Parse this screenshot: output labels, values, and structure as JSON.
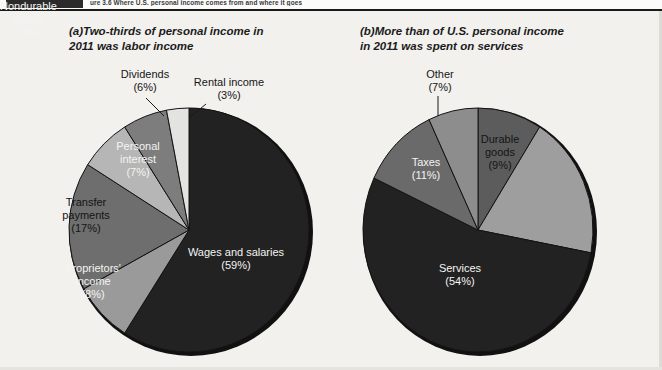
{
  "banner": {
    "caption": "ure 3.6  Where U.S. personal income comes from and where it goes",
    "tab_label": ""
  },
  "panels": [
    {
      "tag": "(a)",
      "title": "Two-thirds of personal income in\n2011 was labor income"
    },
    {
      "tag": "(b)",
      "title": "More than of U.S. personal income\nin 2011 was spent on services"
    }
  ],
  "labels": {
    "dividends": "Dividends\n(6%)",
    "rental": "Rental income\n(3%)",
    "personal_interest": "Personal\ninterest\n(7%)",
    "transfer_payments": "Transfer\npayments\n(17%)",
    "proprietors_income": "Proprietors'\nincome\n(8%)",
    "wages_salaries": "Wages and salaries\n(59%)",
    "other": "Other\n(7%)",
    "durable_goods": "Durable\ngoods\n(9%)",
    "nondurable_goods": "Nondurable\ngoods\n(19%)",
    "services": "Services\n(54%)",
    "taxes": "Taxes\n(11%)"
  },
  "chart_data": [
    {
      "type": "pie",
      "id": "panel-a",
      "title": "(a) Two-thirds of personal income in 2011 was labor income",
      "unit": "percent",
      "start_angle_deg": 0,
      "direction": "clockwise",
      "categories": [
        "Wages and salaries",
        "Proprietors' income",
        "Transfer payments",
        "Personal interest",
        "Dividends",
        "Rental income"
      ],
      "values": [
        59,
        8,
        17,
        7,
        6,
        3
      ],
      "colors": [
        "#222222",
        "#9a9a9a",
        "#6e6e6e",
        "#b6b6b6",
        "#7d7d7d",
        "#e3e3e1"
      ],
      "label_colors": [
        "#f4f4f2",
        "#f4f4f2",
        "#141414",
        "#f4f4f2",
        "#161616",
        "#161616"
      ],
      "legend": "none"
    },
    {
      "type": "pie",
      "id": "panel-b",
      "title": "(b) More than of U.S. personal income in 2011 was spent on services",
      "unit": "percent",
      "start_angle_deg": 0,
      "direction": "clockwise",
      "categories": [
        "Durable goods",
        "Nondurable goods",
        "Services",
        "Taxes",
        "Other"
      ],
      "values": [
        9,
        19,
        54,
        11,
        7
      ],
      "colors": [
        "#5c5c5c",
        "#9e9e9e",
        "#222222",
        "#6a6a6a",
        "#8d8d8d"
      ],
      "label_colors": [
        "#141414",
        "#f4f4f2",
        "#f4f4f2",
        "#f4f4f2",
        "#161616"
      ],
      "legend": "none"
    }
  ],
  "theme": {
    "background": "#f2f1ee",
    "banner_bar": "#2b2b2b",
    "rule": "#1a1a1a",
    "slice_stroke": "#141414"
  }
}
